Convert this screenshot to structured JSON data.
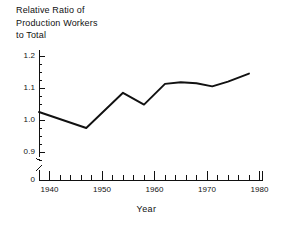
{
  "chart_data": {
    "type": "line",
    "title": "Relative Ratio of\nProduction Workers\nto Total",
    "xlabel": "Year",
    "ylabel": "",
    "xlim": [
      1938,
      1980
    ],
    "ylim": [
      0.855,
      1.2
    ],
    "grid": false,
    "legend": null,
    "x_ticks": [
      1940,
      1950,
      1960,
      1970,
      1980
    ],
    "x_tick_labels": [
      "1940",
      "1950",
      "1960",
      "1970",
      "1980"
    ],
    "x_minor_tick_interval": 2,
    "y_ticks": [
      0.9,
      1.0,
      1.1,
      1.2
    ],
    "y_tick_labels": [
      "0.9",
      "1.0",
      "1.1",
      "1.2"
    ],
    "y_minor_tick_interval": 0.025,
    "y_axis_break": true,
    "y_origin_label": "0",
    "series": [
      {
        "name": "Relative Ratio of Production Workers to Total",
        "color": "#111111",
        "x": [
          1938,
          1947,
          1954,
          1958,
          1962,
          1965,
          1968,
          1971,
          1974,
          1978
        ],
        "values": [
          1.025,
          0.975,
          1.085,
          1.048,
          1.113,
          1.118,
          1.115,
          1.105,
          1.12,
          1.145
        ]
      }
    ]
  },
  "axes": {
    "x_title": "Year",
    "y_origin": "0"
  },
  "colors": {
    "line": "#111111",
    "axis": "#111111",
    "background": "#ffffff"
  }
}
